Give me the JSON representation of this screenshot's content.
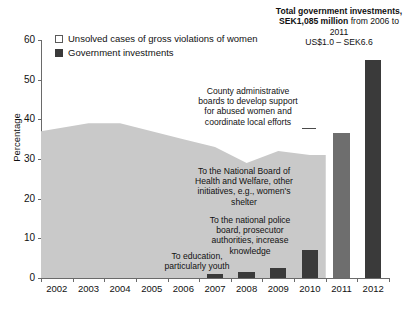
{
  "chart_data": {
    "type": "area",
    "title": "",
    "xlabel": "",
    "ylabel": "Percentage",
    "ylim": [
      0,
      60
    ],
    "ytick_values": [
      0,
      10,
      20,
      30,
      40,
      50,
      60
    ],
    "ytick_labels": [
      "0",
      "10",
      "20",
      "30",
      "40",
      "50",
      "60"
    ],
    "grid": false,
    "legend_position": "top-left",
    "categories": [
      "2002",
      "2003",
      "2004",
      "2005",
      "2006",
      "2007",
      "2008",
      "2009",
      "2010",
      "2011",
      "2012"
    ],
    "series": [
      {
        "name": "Unsolved cases of gross violations of women",
        "type": "area",
        "color": "#c9c9c9",
        "values": [
          37,
          39,
          39,
          37,
          35,
          33,
          29,
          32,
          31,
          null,
          null
        ]
      },
      {
        "name": "Government investments",
        "type": "bar",
        "color": "#3a3a3a",
        "values": [
          null,
          null,
          null,
          null,
          null,
          1,
          1.5,
          2.5,
          7,
          36.5,
          55
        ]
      }
    ],
    "annotations": [
      {
        "id": "anno-county-boards",
        "text": "County administrative boards to develop support for abused women and coordinate local efforts",
        "target_category": "2011"
      },
      {
        "id": "anno-health-welfare",
        "text": "To the National Board of Health and Welfare, other initiatives, e.g., women's shelter",
        "target_category": "2010"
      },
      {
        "id": "anno-police-board",
        "text": "To the national police board, prosecutor authorities, increase knowledge",
        "target_category": "2010"
      },
      {
        "id": "anno-education",
        "text": "To education, particularly youth",
        "target_category": "2007"
      }
    ],
    "header_note": {
      "bold": "Total government investments, SEK1,085 million",
      "rest": " from 2006 to 2011",
      "line2": "US$1.0 – SEK6.6"
    }
  },
  "legend": {
    "items": [
      {
        "label": "Unsolved cases of gross violations of women",
        "marker": "open-square-icon"
      },
      {
        "label": "Government investments",
        "marker": "filled-square-icon"
      }
    ]
  }
}
